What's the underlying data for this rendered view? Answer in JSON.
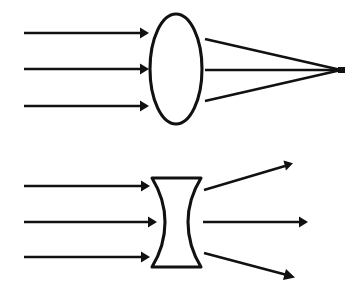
{
  "figure": {
    "background_color": "#ffffff",
    "stroke_color": "#111111",
    "width": 354,
    "height": 292
  },
  "diagrams": [
    {
      "id": "converging-lens",
      "label": "Convex (converging) lens",
      "lens": {
        "shape": "biconvex-ellipse",
        "center_x": 176,
        "center_y": 69,
        "radius_x": 26,
        "radius_y": 55
      },
      "incoming_rays": [
        {
          "name": "incoming-ray-top",
          "x1": 24,
          "y1": 33,
          "x2": 147,
          "y2": 33,
          "arrow": "end"
        },
        {
          "name": "incoming-ray-middle",
          "x1": 24,
          "y1": 69,
          "x2": 147,
          "y2": 69,
          "arrow": "end"
        },
        {
          "name": "incoming-ray-bottom",
          "x1": 24,
          "y1": 106,
          "x2": 147,
          "y2": 106,
          "arrow": "end"
        }
      ],
      "outgoing_rays": [
        {
          "name": "refracted-ray-top",
          "x1": 204,
          "y1": 40,
          "x2": 340,
          "y2": 70,
          "arrow": "none"
        },
        {
          "name": "refracted-ray-middle",
          "x1": 204,
          "y1": 70,
          "x2": 340,
          "y2": 70,
          "arrow": "none"
        },
        {
          "name": "refracted-ray-bottom",
          "x1": 204,
          "y1": 101,
          "x2": 340,
          "y2": 70,
          "arrow": "none"
        }
      ],
      "focal_point": {
        "name": "focal-point",
        "x": 341,
        "y": 70,
        "width": 7,
        "height": 6
      }
    },
    {
      "id": "diverging-lens",
      "label": "Concave (diverging) lens",
      "lens": {
        "shape": "biconcave",
        "top_y": 178,
        "bottom_y": 267,
        "left_outer_x": 152,
        "right_outer_x": 201,
        "left_waist_x": 165,
        "right_waist_x": 188,
        "waist_y": 222
      },
      "incoming_rays": [
        {
          "name": "incoming-ray-top",
          "x1": 24,
          "y1": 186,
          "x2": 148,
          "y2": 186,
          "arrow": "end"
        },
        {
          "name": "incoming-ray-middle",
          "x1": 24,
          "y1": 222,
          "x2": 155,
          "y2": 222,
          "arrow": "end"
        },
        {
          "name": "incoming-ray-bottom",
          "x1": 24,
          "y1": 257,
          "x2": 148,
          "y2": 257,
          "arrow": "end"
        }
      ],
      "outgoing_rays": [
        {
          "name": "diverged-ray-top",
          "x1": 204,
          "y1": 190,
          "x2": 292,
          "y2": 164,
          "arrow": "end"
        },
        {
          "name": "diverged-ray-middle",
          "x1": 203,
          "y1": 222,
          "x2": 307,
          "y2": 222,
          "arrow": "end"
        },
        {
          "name": "diverged-ray-bottom",
          "x1": 204,
          "y1": 253,
          "x2": 294,
          "y2": 277,
          "arrow": "end"
        }
      ]
    }
  ]
}
